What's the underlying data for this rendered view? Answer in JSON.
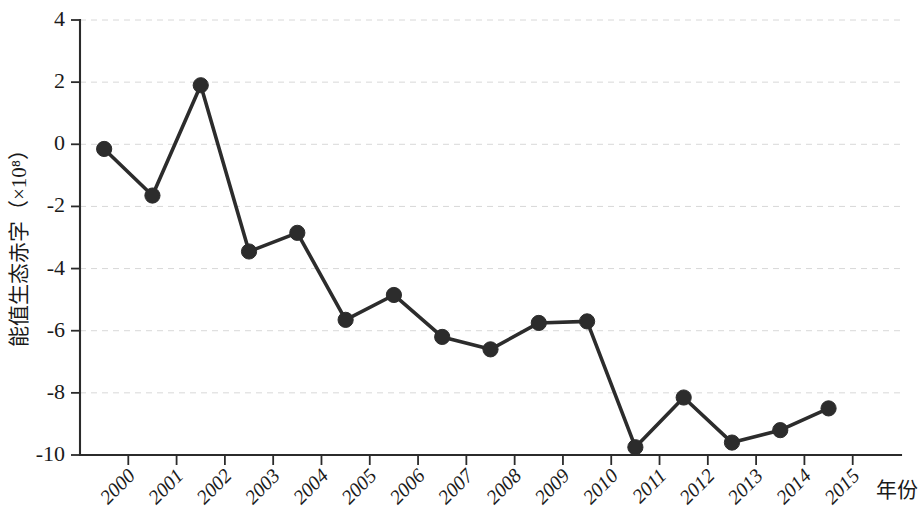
{
  "chart_data": {
    "type": "line",
    "title": "",
    "subtitle": "",
    "xlabel": "年份",
    "ylabel": "能值生态赤字（×10⁸）",
    "categories": [
      "2000",
      "2001",
      "2002",
      "2003",
      "2004",
      "2005",
      "2006",
      "2007",
      "2008",
      "2009",
      "2010",
      "2011",
      "2012",
      "2013",
      "2014",
      "2015"
    ],
    "values": [
      -0.15,
      -1.65,
      1.9,
      -3.45,
      -2.85,
      -5.65,
      -4.85,
      -6.2,
      -6.6,
      -5.75,
      -5.7,
      -9.75,
      -8.15,
      -9.6,
      -9.2,
      -8.5
    ],
    "series": [
      {
        "name": "能值生态赤字",
        "values": [
          -0.15,
          -1.65,
          1.9,
          -3.45,
          -2.85,
          -5.65,
          -4.85,
          -6.2,
          -6.6,
          -5.75,
          -5.7,
          -9.75,
          -8.15,
          -9.6,
          -9.2,
          -8.5
        ]
      }
    ],
    "ylim": [
      -10,
      4
    ],
    "yticks": [
      4,
      2,
      0,
      -2,
      -4,
      -6,
      -8,
      -10
    ],
    "ytick_labels": [
      "4",
      "2",
      "0",
      "-2",
      "-4",
      "-6",
      "-8",
      "-10"
    ],
    "xtick_labels": [
      "2000",
      "2001",
      "2002",
      "2003",
      "2004",
      "2005",
      "2006",
      "2007",
      "2008",
      "2009",
      "2010",
      "2011",
      "2012",
      "2013",
      "2014",
      "2015"
    ],
    "grid": true,
    "grid_axis": "y",
    "legend": false,
    "legend_position": "none",
    "marker": "circle",
    "line_color": "#2c2c2c",
    "marker_color": "#2c2c2c",
    "grid_color": "#d8d8d8",
    "axis_color": "#2b2b2b",
    "background": "#ffffff",
    "xtick_label_rotation": 45
  }
}
